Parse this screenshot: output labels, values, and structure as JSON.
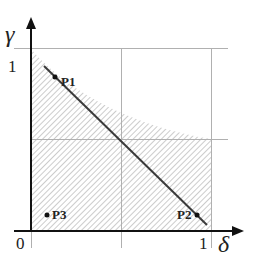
{
  "diagram": {
    "axes": {
      "x_label": "δ",
      "y_label": "γ",
      "origin_label": "0",
      "x_tick_label": "1",
      "y_tick_label": "1"
    },
    "points": [
      {
        "id": "P1",
        "label": "P1",
        "delta": 0.13,
        "gamma": 0.85
      },
      {
        "id": "P2",
        "label": "P2",
        "delta": 0.93,
        "gamma": 0.09
      },
      {
        "id": "P3",
        "label": "P3",
        "delta": 0.09,
        "gamma": 0.09
      }
    ],
    "regions": {
      "hatched_region": "area under curve from (0,1) to (1,0.5), within unit square",
      "diagonal_line": "line from near (0.07,0.9) to (1,0)"
    },
    "colors": {
      "axis": "#111111",
      "grid": "#aaaaaa",
      "hatch": "#999999",
      "line": "#333333"
    }
  }
}
